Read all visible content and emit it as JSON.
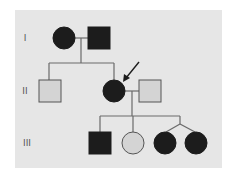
{
  "diagram": {
    "type": "pedigree",
    "colors": {
      "background": "#e6e6e6",
      "affected": "#1c1c1c",
      "unaffected": "#d4d4d4",
      "line": "#6a6a6a",
      "outline": "#555555"
    },
    "generations": [
      {
        "label": "I",
        "y": 38
      },
      {
        "label": "II",
        "y": 91
      },
      {
        "label": "III",
        "y": 143
      }
    ],
    "individuals": [
      {
        "id": "I-1",
        "sex": "female",
        "affected": true,
        "cx": 64,
        "cy": 38
      },
      {
        "id": "I-2",
        "sex": "male",
        "affected": true,
        "cx": 99,
        "cy": 38
      },
      {
        "id": "II-1",
        "sex": "male",
        "affected": false,
        "cx": 50,
        "cy": 91
      },
      {
        "id": "II-2",
        "sex": "female",
        "affected": true,
        "proband": true,
        "cx": 114,
        "cy": 91
      },
      {
        "id": "II-3",
        "sex": "male",
        "affected": false,
        "cx": 150,
        "cy": 91
      },
      {
        "id": "III-1",
        "sex": "male",
        "affected": true,
        "cx": 100,
        "cy": 143
      },
      {
        "id": "III-2",
        "sex": "female",
        "affected": false,
        "cx": 133,
        "cy": 143
      },
      {
        "id": "III-3",
        "sex": "female",
        "affected": true,
        "twin": true,
        "cx": 165,
        "cy": 143
      },
      {
        "id": "III-4",
        "sex": "female",
        "affected": true,
        "twin": true,
        "cx": 196,
        "cy": 143
      }
    ],
    "proband_arrow": {
      "target": "II-2"
    }
  }
}
